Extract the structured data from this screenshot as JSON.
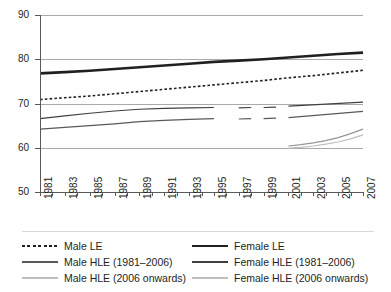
{
  "chart_data": {
    "type": "line",
    "title": "",
    "xlabel": "",
    "ylabel": "",
    "ylim": [
      50,
      90
    ],
    "ytick_values": [
      50,
      60,
      70,
      80,
      90
    ],
    "ytick_labels": [
      "50",
      "60",
      "70",
      "80",
      "90"
    ],
    "grid": "horizontal gridlines at 60, 70, 80, 90",
    "legend_position": "below plot, two columns",
    "xlim": [
      1981,
      2007
    ],
    "x": [
      1981,
      1982,
      1983,
      1984,
      1985,
      1986,
      1987,
      1988,
      1989,
      1990,
      1991,
      1992,
      1993,
      1994,
      1995,
      1996,
      1997,
      1998,
      1999,
      2000,
      2001,
      2002,
      2003,
      2004,
      2005,
      2006,
      2007
    ],
    "xtick_labels": [
      "1981",
      "1983",
      "1985",
      "1987",
      "1989",
      "1991",
      "1993",
      "1995",
      "1997",
      "1999",
      "2001",
      "2003",
      "2005",
      "2007"
    ],
    "xtick_label_rotation": -90,
    "series": [
      {
        "name": "Male LE",
        "style": "dotted",
        "color": "#231f20",
        "width": 1.6,
        "x": [
          1981,
          1983,
          1985,
          1987,
          1989,
          1991,
          1993,
          1995,
          1997,
          1999,
          2001,
          2003,
          2005,
          2007
        ],
        "values": [
          70.9,
          71.3,
          71.7,
          72.2,
          72.7,
          73.2,
          73.7,
          74.2,
          74.7,
          75.2,
          75.8,
          76.3,
          76.9,
          77.5
        ]
      },
      {
        "name": "Female LE",
        "style": "solid",
        "color": "#231f20",
        "width": 2.6,
        "x": [
          1981,
          1983,
          1985,
          1987,
          1989,
          1991,
          1993,
          1995,
          1997,
          1999,
          2001,
          2003,
          2005,
          2007
        ],
        "values": [
          76.8,
          77.1,
          77.4,
          77.8,
          78.2,
          78.6,
          79.0,
          79.4,
          79.7,
          80.0,
          80.4,
          80.8,
          81.2,
          81.5
        ]
      },
      {
        "name": "Male HLE (1981–2006)",
        "style": "solid",
        "color": "#58595b",
        "width": 1.2,
        "x": [
          1981,
          1983,
          1985,
          1987,
          1989,
          1991,
          1993,
          1995
        ],
        "values": [
          64.2,
          64.6,
          65.0,
          65.4,
          65.9,
          66.2,
          66.4,
          66.6
        ]
      },
      {
        "name": "Male HLE (1981–2006) segment 2",
        "style": "solid",
        "color": "#58595b",
        "width": 1.2,
        "x": [
          1997,
          1998
        ],
        "values": [
          66.5,
          66.6
        ]
      },
      {
        "name": "Male HLE (1981–2006) segment 3",
        "style": "solid",
        "color": "#58595b",
        "width": 1.2,
        "x": [
          1999,
          2000
        ],
        "values": [
          66.6,
          66.7
        ]
      },
      {
        "name": "Male HLE (1981–2006) segment 4",
        "style": "solid",
        "color": "#58595b",
        "width": 1.2,
        "x": [
          2001,
          2007
        ],
        "values": [
          66.8,
          68.2
        ]
      },
      {
        "name": "Female HLE (1981–2006)",
        "style": "solid",
        "color": "#404041",
        "width": 1.2,
        "x": [
          1981,
          1983,
          1985,
          1987,
          1989,
          1991,
          1993,
          1995
        ],
        "values": [
          66.6,
          67.2,
          67.8,
          68.3,
          68.7,
          68.9,
          69.0,
          69.1
        ]
      },
      {
        "name": "Female HLE (1981–2006) segment 2",
        "style": "solid",
        "color": "#404041",
        "width": 1.2,
        "x": [
          1997,
          1998
        ],
        "values": [
          69.0,
          69.1
        ]
      },
      {
        "name": "Female HLE (1981–2006) segment 3",
        "style": "solid",
        "color": "#404041",
        "width": 1.2,
        "x": [
          1999,
          2000
        ],
        "values": [
          69.1,
          69.2
        ]
      },
      {
        "name": "Female HLE (1981–2006) segment 4",
        "style": "solid",
        "color": "#404041",
        "width": 1.4,
        "x": [
          2001,
          2007
        ],
        "values": [
          69.4,
          70.3
        ]
      },
      {
        "name": "Male HLE (2006 onwards)",
        "style": "solid",
        "color": "#bcbec0",
        "width": 1.2,
        "x": [
          2001,
          2002,
          2003,
          2004,
          2005,
          2006,
          2007
        ],
        "values": [
          59.9,
          60.1,
          60.4,
          60.8,
          61.3,
          62.0,
          62.9
        ]
      },
      {
        "name": "Female HLE (2006 onwards)",
        "style": "solid",
        "color": "#939598",
        "width": 1.2,
        "x": [
          2001,
          2002,
          2003,
          2004,
          2005,
          2006,
          2007
        ],
        "values": [
          60.4,
          60.7,
          61.1,
          61.6,
          62.3,
          63.2,
          64.2
        ]
      }
    ],
    "legend": [
      {
        "label": "Male LE",
        "style": "dotted",
        "color": "#231f20",
        "width": 1.6
      },
      {
        "label": "Female LE",
        "style": "solid",
        "color": "#231f20",
        "width": 2.6
      },
      {
        "label": "Male HLE (1981–2006)",
        "style": "solid",
        "color": "#58595b",
        "width": 1.2
      },
      {
        "label": "Female HLE (1981–2006)",
        "style": "solid",
        "color": "#404041",
        "width": 1.2
      },
      {
        "label": "Male HLE (2006 onwards)",
        "style": "solid",
        "color": "#bcbec0",
        "width": 1.4
      },
      {
        "label": "Female HLE (2006 onwards)",
        "style": "solid",
        "color": "#bcbec0",
        "width": 1.4
      }
    ]
  }
}
